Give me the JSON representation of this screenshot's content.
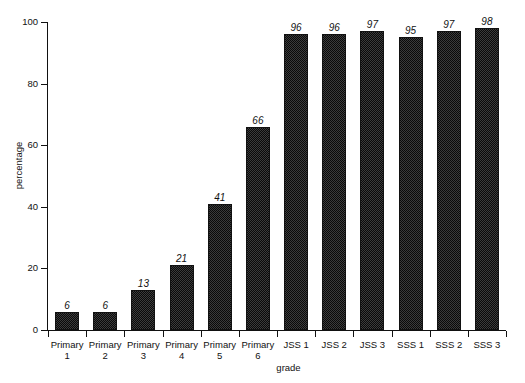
{
  "top_caption_sliver": "",
  "chart_data": {
    "type": "bar",
    "title": "",
    "subtitle": "",
    "xlabel": "grade",
    "ylabel": "percentage",
    "categories": [
      "Primary 1",
      "Primary 2",
      "Primary 3",
      "Primary 4",
      "Primary 5",
      "Primary 6",
      "JSS 1",
      "JSS 2",
      "JSS 3",
      "SSS 1",
      "SSS 2",
      "SSS 3"
    ],
    "category_lines": [
      [
        "Primary",
        "1"
      ],
      [
        "Primary",
        "2"
      ],
      [
        "Primary",
        "3"
      ],
      [
        "Primary",
        "4"
      ],
      [
        "Primary",
        "5"
      ],
      [
        "Primary",
        "6"
      ],
      [
        "JSS 1"
      ],
      [
        "JSS 2"
      ],
      [
        "JSS 3"
      ],
      [
        "SSS 1"
      ],
      [
        "SSS 2"
      ],
      [
        "SSS 3"
      ]
    ],
    "values": [
      6,
      6,
      13,
      21,
      41,
      66,
      96,
      96,
      97,
      95,
      97,
      98
    ],
    "data_labels": [
      "6",
      "6",
      "13",
      "21",
      "41",
      "66",
      "96",
      "96",
      "97",
      "95",
      "97",
      "98"
    ],
    "ylim": [
      0,
      100
    ],
    "yticks": [
      0,
      20,
      40,
      60,
      80,
      100
    ],
    "ytick_labels": [
      "0",
      "20",
      "40",
      "60",
      "80",
      "100"
    ],
    "grid": false,
    "legend": null,
    "legend_position": "none",
    "bar_color": "#3b3b3b",
    "bar_edge_color": "#111111",
    "axis_color": "#111111",
    "background_color": "#ffffff",
    "data_label_style": "italic"
  }
}
